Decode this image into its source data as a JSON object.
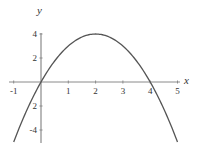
{
  "chart_data": {
    "type": "line",
    "title": "",
    "function": "y = 4x - x^2",
    "xlabel": "x",
    "ylabel": "y",
    "xlim": [
      -1,
      5
    ],
    "ylim": [
      -5,
      4
    ],
    "grid": false,
    "legend": null,
    "x_ticks": [
      -1,
      1,
      2,
      3,
      4,
      5
    ],
    "x_tick_labels": [
      "-1",
      "1",
      "2",
      "3",
      "4",
      "5"
    ],
    "y_ticks": [
      4,
      2,
      -2,
      -4
    ],
    "y_tick_labels": [
      "4",
      "2",
      "2",
      "-4"
    ],
    "series": [
      {
        "name": "parabola",
        "x": [
          -1,
          -0.5,
          0,
          0.5,
          1,
          1.5,
          2,
          2.5,
          3,
          3.5,
          4,
          4.5,
          5
        ],
        "y": [
          -5,
          -2.25,
          0,
          1.75,
          3,
          3.75,
          4,
          3.75,
          3,
          1.75,
          0,
          -2.25,
          -5
        ]
      }
    ],
    "annotations": {
      "vertex": [
        2,
        4
      ],
      "roots": [
        0,
        4
      ]
    },
    "colors": {
      "curve": "#555555",
      "axes": "#8a8a8a",
      "text": "#333333"
    }
  }
}
